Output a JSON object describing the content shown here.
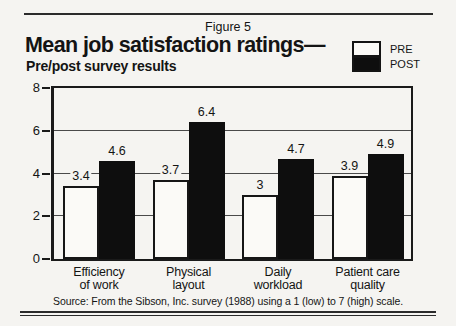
{
  "figure_label": "Figure 5",
  "title": "Mean job satisfaction ratings—",
  "subtitle": "Pre/post survey results",
  "source": "Source: From the Sibson, Inc. survey (1988) using a 1 (low) to 7 (high) scale.",
  "colors": {
    "ink": "#141414",
    "page_bg": "#f5f4f1",
    "pre_fill": "#fbfaf7",
    "post_fill": "#0e0e0e"
  },
  "chart_data": {
    "type": "bar",
    "categories": [
      {
        "line1": "Efficiency",
        "line2": "of work"
      },
      {
        "line1": "Physical",
        "line2": "layout"
      },
      {
        "line1": "Daily",
        "line2": "workload"
      },
      {
        "line1": "Patient care",
        "line2": "quality"
      }
    ],
    "series": [
      {
        "name": "PRE",
        "values": [
          3.4,
          3.7,
          3,
          3.9
        ]
      },
      {
        "name": "POST",
        "values": [
          4.6,
          6.4,
          4.7,
          4.9
        ]
      }
    ],
    "ylim": [
      0,
      8
    ],
    "yticks": [
      0,
      2,
      4,
      6,
      8
    ],
    "gridlines": [
      2,
      4,
      6
    ],
    "legend_position": "top-right",
    "value_labels_shown": true,
    "grid": "horizontal"
  }
}
